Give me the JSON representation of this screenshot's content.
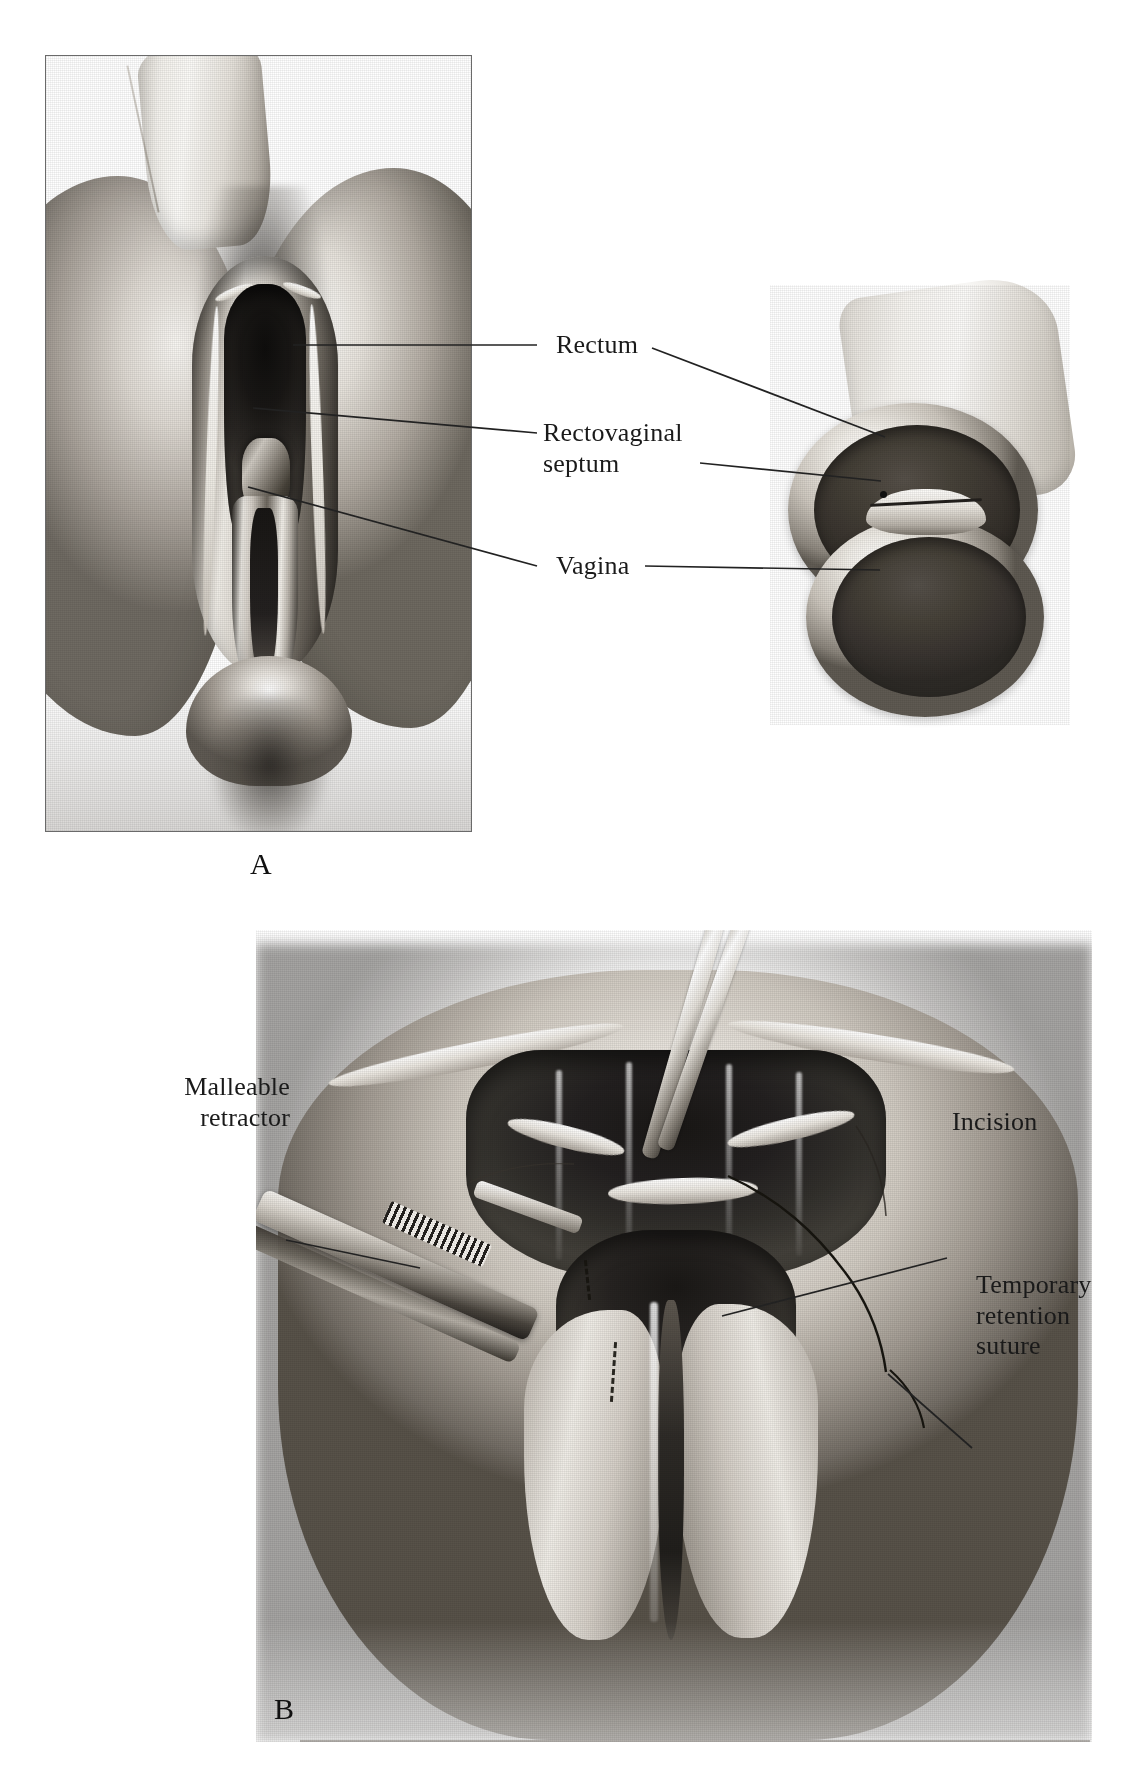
{
  "figure": {
    "panels": [
      {
        "letter": "A",
        "caption_letter": "A",
        "view": "perineal view with retracted anal canal and cross-section inset",
        "labels": [
          {
            "id": "rectum",
            "text": "Rectum"
          },
          {
            "id": "rectovaginal-septum",
            "text": "Rectovaginal\nseptum"
          },
          {
            "id": "vagina",
            "text": "Vagina"
          }
        ],
        "inset": {
          "name": "cross-section",
          "parts": [
            {
              "id": "rectum-lumen",
              "label": "Rectum"
            },
            {
              "id": "septum",
              "label": "Rectovaginal septum"
            },
            {
              "id": "vagina-lumen",
              "label": "Vagina"
            }
          ]
        }
      },
      {
        "letter": "B",
        "caption_letter": "B",
        "view": "operative field with retractor, forceps and planned incision",
        "labels": [
          {
            "id": "malleable-retractor",
            "text": "Malleable\nretractor"
          },
          {
            "id": "incision",
            "text": "Incision"
          },
          {
            "id": "temporary-retention-suture",
            "text": "Temporary\nretention\nsuture"
          }
        ],
        "instruments": [
          {
            "id": "forceps",
            "name": "tissue-forceps"
          },
          {
            "id": "malleable-retractor",
            "name": "malleable-retractor"
          }
        ]
      }
    ]
  },
  "style": {
    "page_background": "#ffffff",
    "ink": "#1a1a1a",
    "frame_border": "#6a6a6a",
    "leader_line": "#222222",
    "midtone": "#b5afa6",
    "shadow": "#2b2825"
  }
}
